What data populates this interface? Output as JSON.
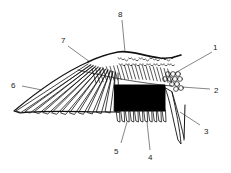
{
  "diagram": {
    "colors": {
      "ink": "#111111",
      "background": "#ffffff",
      "speculum": "#000000"
    },
    "labels": [
      {
        "id": "1",
        "text": "1"
      },
      {
        "id": "2",
        "text": "2"
      },
      {
        "id": "3",
        "text": "3"
      },
      {
        "id": "4",
        "text": "4"
      },
      {
        "id": "5",
        "text": "5"
      },
      {
        "id": "6",
        "text": "6"
      },
      {
        "id": "7",
        "text": "7"
      },
      {
        "id": "8",
        "text": "8"
      }
    ]
  }
}
